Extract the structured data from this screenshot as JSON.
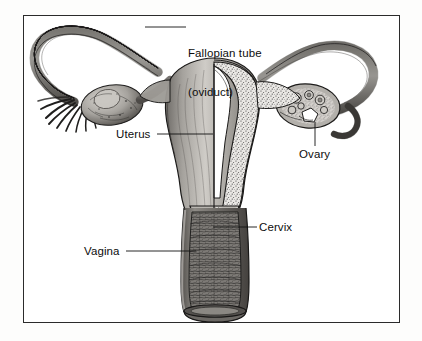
{
  "figure": {
    "domain_kind": "anatomical-line-illustration",
    "style": "black-and-white pen-and-ink stipple engraving",
    "border_color": "#2b2b2b",
    "page_background": "#fdfdfc",
    "figure_background": "#ffffff",
    "ink_color": "#1a1a1a",
    "leader_line_color": "#111111"
  },
  "labels": [
    {
      "id": "fallopian-tube",
      "line1": "Fallopian tube",
      "line2": "(oviduct)",
      "leader": "horizontal-left"
    },
    {
      "id": "uterus",
      "line1": "Uterus",
      "line2": "",
      "leader": "horizontal-right"
    },
    {
      "id": "ovary",
      "line1": "Ovary",
      "line2": "",
      "leader": "vertical-up"
    },
    {
      "id": "cervix",
      "line1": "Cervix",
      "line2": "",
      "leader": "horizontal-left"
    },
    {
      "id": "vagina",
      "line1": "Vagina",
      "line2": "",
      "leader": "horizontal-right"
    }
  ],
  "structures": [
    "left fallopian tube with fimbriae",
    "left ovary (solid, textured surface)",
    "uterus body with cutaway myometrium and uterine cavity",
    "right fallopian tube",
    "right ovary (cross-section showing follicles)",
    "cervix projecting into vaginal canal",
    "vagina with rugae, open cut end"
  ]
}
